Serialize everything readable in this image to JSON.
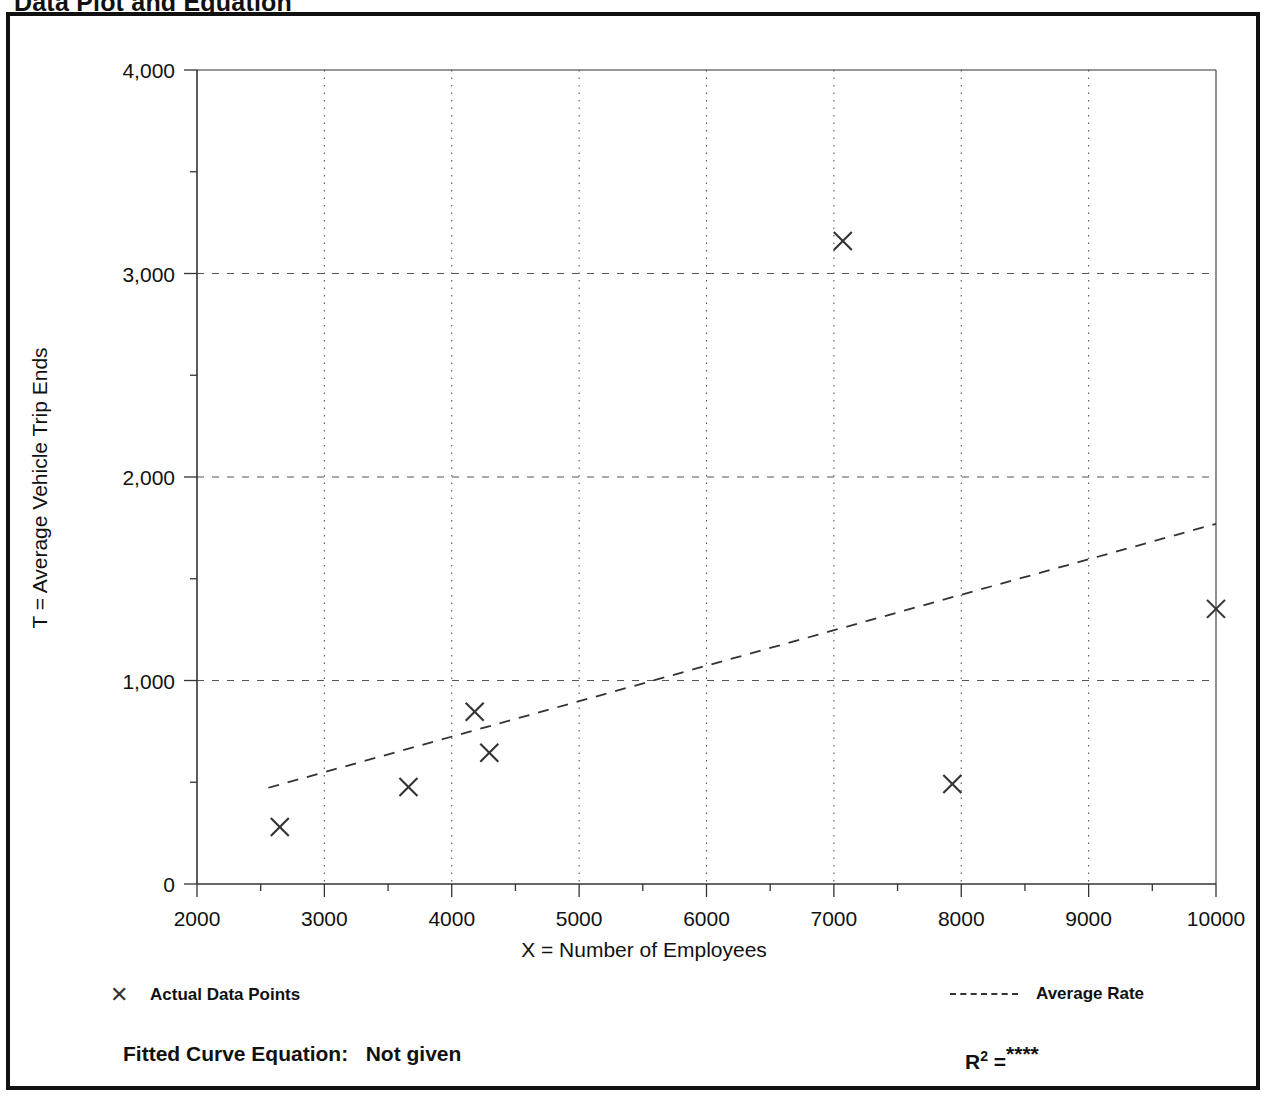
{
  "page": {
    "title": "Data Plot and Equation"
  },
  "chart_data": {
    "type": "scatter",
    "title": "Data Plot and Equation",
    "xlabel": "X = Number of Employees",
    "ylabel": "T = Average Vehicle Trip Ends",
    "xlim": [
      2000,
      10000
    ],
    "ylim": [
      0,
      4000
    ],
    "x_ticks": [
      "2000",
      "3000",
      "4000",
      "5000",
      "6000",
      "7000",
      "8000",
      "9000",
      "10000"
    ],
    "x_tick_values": [
      2000,
      3000,
      4000,
      5000,
      6000,
      7000,
      8000,
      9000,
      10000
    ],
    "x_minor_step": 500,
    "y_ticks": [
      "0",
      "1,000",
      "2,000",
      "3,000",
      "4,000"
    ],
    "y_tick_values": [
      0,
      1000,
      2000,
      3000,
      4000
    ],
    "y_minor_step": 500,
    "grid": "dotted vertical at major x ticks; dashed horizontal at 1,000 / 2,000 / 3,000",
    "legend_position": "below plot, left and right",
    "series": [
      {
        "name": "Actual Data Points",
        "type": "scatter",
        "marker": "x",
        "points": [
          {
            "x": 2650,
            "y": 280
          },
          {
            "x": 3660,
            "y": 477
          },
          {
            "x": 4180,
            "y": 847
          },
          {
            "x": 4295,
            "y": 645
          },
          {
            "x": 7070,
            "y": 3160
          },
          {
            "x": 7930,
            "y": 491
          },
          {
            "x": 10000,
            "y": 1352
          }
        ]
      },
      {
        "name": "Average Rate",
        "type": "line",
        "style": "dashed",
        "points": [
          {
            "x": 2560,
            "y": 473
          },
          {
            "x": 10000,
            "y": 1770
          }
        ]
      }
    ]
  },
  "legend": {
    "actual_marker": "x-marker-icon",
    "actual_label": "Actual Data Points",
    "average_swatch": "dashed-line-icon",
    "average_label": "Average Rate"
  },
  "footer": {
    "equation_label": "Fitted Curve Equation:",
    "equation_value": "Not given",
    "r2_label": "R",
    "r2_exponent": "2",
    "r2_equals": "=",
    "r2_value": "****"
  },
  "colors": {
    "frame": "#111111",
    "axis": "#333333",
    "grid": "#555555",
    "marker": "#333333",
    "trendline": "#333333",
    "background": "#ffffff"
  }
}
